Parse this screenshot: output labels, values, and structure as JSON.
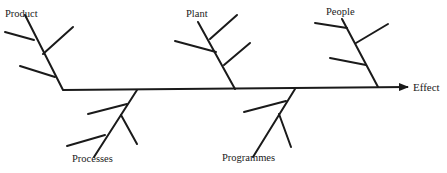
{
  "diagram": {
    "type": "fishbone",
    "effect": "Effect",
    "categories": [
      {
        "label": "Product",
        "position": "top",
        "sub_branches": 3
      },
      {
        "label": "Plant",
        "position": "top",
        "sub_branches": 3
      },
      {
        "label": "People",
        "position": "top",
        "sub_branches": 3
      },
      {
        "label": "Processes",
        "position": "bottom",
        "sub_branches": 3
      },
      {
        "label": "Programmes",
        "position": "bottom",
        "sub_branches": 2
      }
    ]
  }
}
